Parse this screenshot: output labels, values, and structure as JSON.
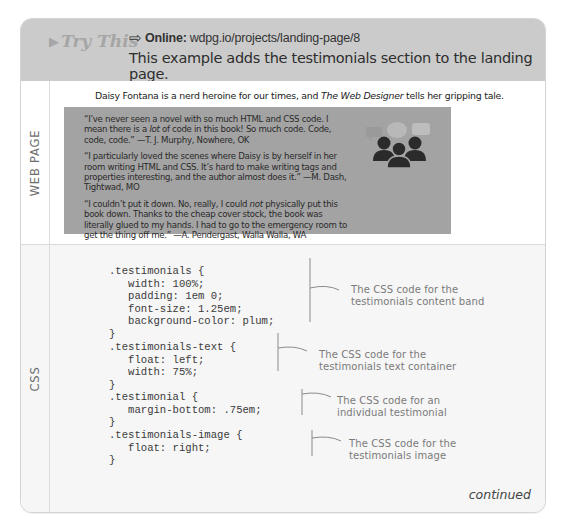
{
  "header": {
    "try_this": "Try This",
    "online_label": "Online:",
    "online_url": "wdpg.io/projects/landing-page/8",
    "description": "This example adds the testimonials section to the landing page.",
    "icons": {
      "try_this": "play-triangle-icon",
      "online": "right-arrow-outline-icon"
    }
  },
  "web_page": {
    "label": "WEB PAGE",
    "intro_before": "Daisy Fontana is a nerd heroine for our times, and ",
    "intro_italic": "The Web Designer",
    "intro_after": " tells her gripping tale.",
    "band_color": "#a3a3a3",
    "testimonials": [
      {
        "before": "“I’ve never seen a novel with so much HTML and CSS code. I mean there is a ",
        "italic": "lot",
        "after": " of code in this book! So much code. Code, code, code.” —T. J. Murphy, Nowhere, OK"
      },
      {
        "before": "“I particularly loved the scenes where Daisy is by herself in her room writing HTML and CSS. It’s hard to make writing tags and properties interesting, and the author almost does it.” —M. Dash, Tightwad, MO",
        "italic": "",
        "after": ""
      },
      {
        "before": "“I couldn’t put it down. No, really, I could ",
        "italic": "not",
        "after": " physically put this book down. Thanks to the cheap cover stock, the book was literally glued to my hands. I had to go to the emergency room to get the thing off me.” —A. Pendergast, Walla Walla, WA"
      }
    ],
    "image_icon": "group-with-speech-bubbles-icon"
  },
  "css": {
    "label": "CSS",
    "code_blocks": [
      ".testimonials {\n   width: 100%;\n   padding: 1em 0;\n   font-size: 1.25em;\n   background-color: plum;\n}",
      ".testimonials-text {\n   float: left;\n   width: 75%;\n}",
      ".testimonial {\n   margin-bottom: .75em;\n}",
      ".testimonials-image {\n   float: right;\n}"
    ],
    "annotations": [
      {
        "line1": "The CSS code for the",
        "line2": "testimonials content band"
      },
      {
        "line1": "The CSS code for the",
        "line2": "testimonials text container"
      },
      {
        "line1": "The CSS code for an",
        "line2": "individual testimonial"
      },
      {
        "line1": "The CSS code for the",
        "line2": "testimonials image"
      }
    ]
  },
  "footer": {
    "continued": "continued"
  }
}
